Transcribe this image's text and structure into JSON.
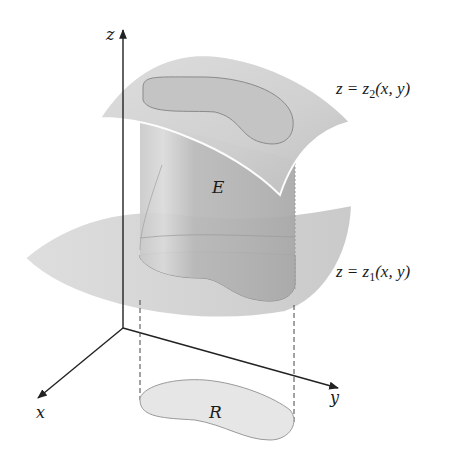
{
  "figure": {
    "axes": {
      "x_label": "x",
      "y_label": "y",
      "z_label": "z"
    },
    "labels": {
      "region_solid": "E",
      "region_base": "R"
    },
    "upper_surface": {
      "lhs": "z = z",
      "sub": "2",
      "rhs": "(x, y)"
    },
    "lower_surface": {
      "lhs": "z = z",
      "sub": "1",
      "rhs": "(x, y)"
    },
    "colors": {
      "surface_fill": "#d4d4d4",
      "cylinder_fill": "#bdbdbd",
      "base_fill": "#e6e6e6",
      "axis": "#222222",
      "edge_highlight": "#ffffff",
      "outline": "#8a8a8a"
    }
  }
}
